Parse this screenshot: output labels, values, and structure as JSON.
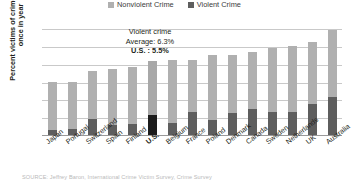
{
  "chart_data": {
    "type": "bar",
    "subtype": "stacked-vertical",
    "title": "",
    "xlabel": "",
    "ylabel": "Percent victims of crime at least once in year",
    "ylim": [
      0,
      32
    ],
    "yticks": [
      5,
      10,
      15,
      20,
      25,
      30
    ],
    "grid": true,
    "legend_position": "top-center",
    "categories": [
      "Japan",
      "Portugal",
      "Switzerland",
      "Spain",
      "Finland",
      "U.S.",
      "Belgium",
      "France",
      "Poland",
      "Denmark",
      "Canada",
      "Sweden",
      "Netherlands",
      "UK",
      "Australia"
    ],
    "series": [
      {
        "name": "Violent Crime",
        "color": "#5e5e5e",
        "values": [
          1.3,
          1.8,
          4.6,
          2.8,
          3.2,
          5.5,
          3.3,
          6.6,
          4.3,
          6.1,
          7.2,
          6.4,
          6.4,
          8.8,
          10.6
        ]
      },
      {
        "name": "Nonviolent Crime",
        "color": "#b0b0b0",
        "values": [
          13.7,
          13.2,
          13.4,
          15.7,
          15.8,
          15.4,
          17.7,
          14.4,
          18.1,
          16.5,
          16.2,
          18.0,
          18.5,
          17.2,
          18.9
        ]
      }
    ],
    "totals": [
      15.0,
      15.0,
      18.0,
      18.5,
      19.0,
      20.9,
      21.0,
      21.0,
      22.4,
      22.6,
      23.4,
      24.4,
      24.9,
      26.0,
      29.5
    ],
    "highlight_category": "U.S.",
    "annotations": [
      {
        "line": "Violent crime",
        "bold": false
      },
      {
        "line": "Average: 6.3%",
        "bold": false
      },
      {
        "line": "U.S. : 5.5%",
        "bold": true
      }
    ]
  },
  "legend": {
    "entries": [
      {
        "label": "Nonviolent Crime",
        "color": "#b0b0b0"
      },
      {
        "label": "Violent Crime",
        "color": "#5e5e5e"
      }
    ]
  },
  "axis": {
    "ylabel": "Percent victims of crime at least once in year",
    "yticks": [
      "30",
      "25",
      "20",
      "15",
      "10",
      "5"
    ]
  },
  "annotation": {
    "line1": "Violent crime",
    "line2": "Average: 6.3%",
    "line3": "U.S. : 5.5%"
  },
  "source": {
    "text": "SOURCE: Jeffrey Baron, International Crime Victim Survey, Crime Survey"
  }
}
